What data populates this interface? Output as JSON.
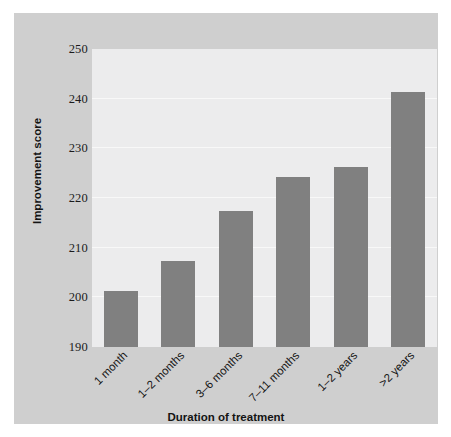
{
  "chart_data": {
    "type": "bar",
    "title": "",
    "categories": [
      "1 month",
      "1–2 months",
      "3–6 months",
      "7–11 months",
      "1–2 years",
      ">2 years"
    ],
    "values": [
      201.2,
      207.3,
      217.3,
      224.3,
      226.3,
      241.3
    ],
    "xlabel": "Duration of treatment",
    "ylabel": "Improvement score",
    "ylim": [
      190,
      250
    ],
    "yticks": [
      190,
      200,
      210,
      220,
      230,
      240,
      250
    ],
    "ytick_labels": [
      "190",
      "200",
      "210",
      "220",
      "230",
      "240",
      "250"
    ],
    "grid": true,
    "grid_axis": "y",
    "legend": false,
    "bar_color": "#808080",
    "plot_background": "#ececed",
    "panel_background": "#cfcfcf",
    "figure_background": "#ffffff",
    "gridline_color": "#f8f8f8",
    "xtick_rotation": -45,
    "series": [
      {
        "name": "Improvement score",
        "values": [
          201.2,
          207.3,
          217.3,
          224.3,
          226.3,
          241.3
        ]
      }
    ]
  }
}
